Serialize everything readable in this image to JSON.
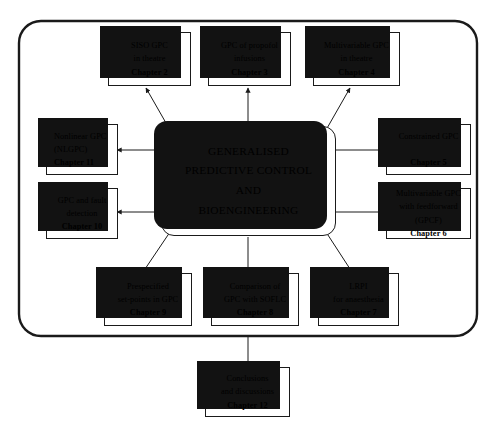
{
  "diagram": {
    "type": "block-flow-diagram",
    "title_node": {
      "name": "generalised-predictive-control-and-bioengineering",
      "lines": [
        "GENERALISED",
        "PREDICTIVE CONTROL",
        "AND",
        "BIOENGINEERING"
      ]
    },
    "frame": {
      "name": "outer-grouping-frame",
      "style": "rounded-rectangle"
    },
    "nodes": [
      {
        "id": "chapter-2",
        "name": "siso-gpc-in-theatre",
        "lines": [
          "SISO GPC",
          "in theatre"
        ],
        "chapter": "Chapter 2"
      },
      {
        "id": "chapter-3",
        "name": "gpc-of-propofol-infusions",
        "lines": [
          "GPC of propofol",
          "infusions"
        ],
        "chapter": "Chapter 3"
      },
      {
        "id": "chapter-4",
        "name": "multivariable-gpc-in-theatre",
        "lines": [
          "Multivariable GPC",
          "in theatre"
        ],
        "chapter": "Chapter 4"
      },
      {
        "id": "chapter-5",
        "name": "constrained-gpc",
        "lines": [
          "Constrained GPC",
          ""
        ],
        "chapter": "Chapter 5"
      },
      {
        "id": "chapter-6",
        "name": "multivariable-gpc-with-feedforward",
        "lines": [
          "Multivariable GPC",
          "with feedforward",
          "(GPCF)"
        ],
        "chapter": "Chapter 6"
      },
      {
        "id": "chapter-7",
        "name": "lrpi-for-anaesthesia",
        "lines": [
          "LRPI",
          "for anaesthesia"
        ],
        "chapter": "Chapter 7"
      },
      {
        "id": "chapter-8",
        "name": "comparison-of-gpc-with-soflc",
        "lines": [
          "Comparison of",
          "GPC with SOFLC"
        ],
        "chapter": "Chapter 8"
      },
      {
        "id": "chapter-9",
        "name": "prespecified-set-points-in-gpc",
        "lines": [
          "Prespecified",
          "set-points in GPC"
        ],
        "chapter": "Chapter 9"
      },
      {
        "id": "chapter-10",
        "name": "gpc-and-fault-detection",
        "lines": [
          "GPC and fault",
          "detection"
        ],
        "chapter": "Chapter 10"
      },
      {
        "id": "chapter-11",
        "name": "nonlinear-gpc-nlgpc",
        "lines": [
          "Nonlinear GPC",
          "(NLGPC)"
        ],
        "chapter": "Chapter 11"
      },
      {
        "id": "chapter-12",
        "name": "conclusions-and-discussions",
        "lines": [
          "Conclusions",
          "and discussions"
        ],
        "chapter": "Chapter 12"
      }
    ],
    "edges": [
      {
        "name": "edge-center-to-chapter-2",
        "from": "centre",
        "to": "chapter-2",
        "arrow": "to-node"
      },
      {
        "name": "edge-center-to-chapter-3",
        "from": "centre",
        "to": "chapter-3",
        "arrow": "to-node"
      },
      {
        "name": "edge-center-to-chapter-4",
        "from": "centre",
        "to": "chapter-4",
        "arrow": "to-node"
      },
      {
        "name": "edge-center-to-chapter-5",
        "from": "centre",
        "to": "chapter-5",
        "arrow": "to-node"
      },
      {
        "name": "edge-center-to-chapter-6",
        "from": "centre",
        "to": "chapter-6",
        "arrow": "to-node"
      },
      {
        "name": "edge-center-to-chapter-7",
        "from": "centre",
        "to": "chapter-7",
        "arrow": "to-node"
      },
      {
        "name": "edge-center-to-chapter-8",
        "from": "centre",
        "to": "chapter-8",
        "arrow": "to-node"
      },
      {
        "name": "edge-center-to-chapter-9",
        "from": "centre",
        "to": "chapter-9",
        "arrow": "to-node"
      },
      {
        "name": "edge-center-to-chapter-10",
        "from": "centre",
        "to": "chapter-10",
        "arrow": "to-node"
      },
      {
        "name": "edge-center-to-chapter-11",
        "from": "centre",
        "to": "chapter-11",
        "arrow": "to-node"
      },
      {
        "name": "edge-frame-to-chapter-12",
        "from": "frame",
        "to": "chapter-12",
        "arrow": "to-node"
      }
    ]
  },
  "colors": {
    "line": "#1a1a1a",
    "shadow": "#121212",
    "card": "#ffffff",
    "background": "#ffffff"
  }
}
